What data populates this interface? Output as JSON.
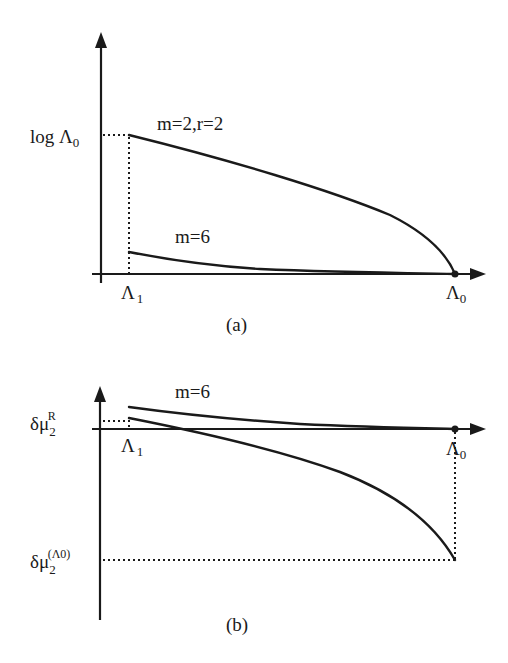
{
  "figure": {
    "panels": [
      {
        "id": "a",
        "caption": "(a)",
        "y_axis_label": {
          "prefix": "log Λ",
          "subscript": "0"
        },
        "x_ticks": [
          {
            "base": "Λ",
            "subscript": "1"
          },
          {
            "base": "Λ",
            "subscript": "0"
          }
        ],
        "curves": [
          {
            "label": "m=2,r=2",
            "description": "starts at log Λ0 at Λ1, decreases concavely to zero at Λ0"
          },
          {
            "label": "m=6",
            "description": "starts slightly above zero at Λ1, decays toward zero at Λ0"
          }
        ]
      },
      {
        "id": "b",
        "caption": "(b)",
        "y_axis_labels": [
          {
            "base": "δμ",
            "subscript": "2",
            "superscript": "R"
          },
          {
            "base": "δμ",
            "subscript": "2",
            "superscript": "(Λ0)"
          }
        ],
        "x_ticks": [
          {
            "base": "Λ",
            "subscript": "1"
          },
          {
            "base": "Λ",
            "subscript": "0"
          }
        ],
        "curves": [
          {
            "label": "m=6",
            "description": "starts slightly above zero at Λ1, decays toward zero at Λ0"
          },
          {
            "label": "",
            "description": "starts at δμ2^R at Λ1, crosses zero, decreases to δμ2^(Λ0) at Λ0"
          }
        ]
      }
    ]
  }
}
